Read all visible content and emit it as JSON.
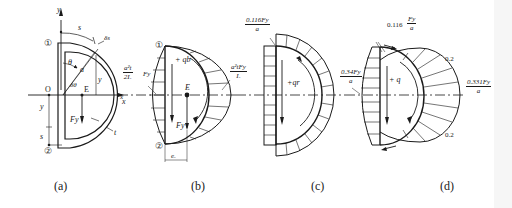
{
  "figure": {
    "panels": [
      {
        "id": "a",
        "caption": "(a)",
        "labels": {
          "axis_y_top": "y",
          "axis_x": "x",
          "point_1": "①",
          "point_2": "②",
          "origin": "O",
          "centroid": "E",
          "arc_length": "s",
          "angle": "θ",
          "radius": "a",
          "d_theta": "δθ",
          "d_s": "δs",
          "y_coord": "y",
          "y_left": "y",
          "s_left": "s",
          "force": "Fy",
          "thickness": "t"
        }
      },
      {
        "id": "b",
        "caption": "(b)",
        "labels": {
          "point_1": "①",
          "point_2": "②",
          "centroid": "E",
          "flow": "+ qb",
          "force": "Fy",
          "offset": "eₓ",
          "x_axis": "x",
          "left_value_num": "a²t",
          "left_value_den": "2Iₓ",
          "left_value_suffix": "Fy",
          "right_value_num": "a²tFy",
          "right_value_den": "Iₓ"
        }
      },
      {
        "id": "c",
        "caption": "(c)",
        "labels": {
          "flow": "+qr",
          "top_value_num": "0.116Fy",
          "top_value_den": "a"
        }
      },
      {
        "id": "d",
        "caption": "(d)",
        "labels": {
          "flow": "+ q",
          "top_value_prefix": "0.116",
          "top_value_num": "Fy",
          "top_value_den": "a",
          "left_value_num": "0.34Fy",
          "left_value_den": "a",
          "right_value_num": "0.331Fy",
          "right_value_den": "a",
          "upper_tick": "0.2",
          "lower_tick": "0.2"
        }
      }
    ]
  },
  "colors": {
    "ink": "#1a1a1a",
    "background": "#ffffff",
    "strip": "#f6f6f6"
  }
}
